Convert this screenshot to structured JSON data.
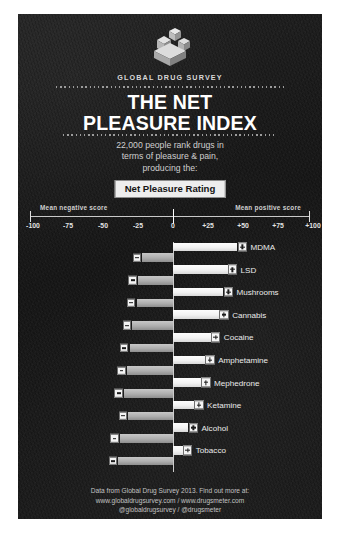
{
  "poster": {
    "brand": "GLOBAL DRUG SURVEY",
    "title_line1": "THE NET",
    "title_line2": "PLEASURE INDEX",
    "subtitle_line1": "22,000 people rank drugs in",
    "subtitle_line2": "terms of pleasure & pain,",
    "subtitle_line3": "producing the:",
    "rating_chip": "Net Pleasure Rating",
    "logo_icon": "global-drug-survey-cubes-logo"
  },
  "axis": {
    "caption_negative": "Mean negative score",
    "caption_positive": "Mean positive score",
    "ticks": [
      "-100",
      "-75",
      "-50",
      "-25",
      "0",
      "+25",
      "+50",
      "+75",
      "+100"
    ],
    "tick_values": [
      -100,
      -75,
      -50,
      -25,
      0,
      25,
      50,
      75,
      100
    ]
  },
  "markers": {
    "positive_icon": "plus-square-icon",
    "negative_icon": "minus-square-icon"
  },
  "footer": {
    "line1": "Data from Global Drug Survey 2013.  Find out more at:",
    "line2": "www.globaldrugsurvey.com  /  www.drugsmeter.com",
    "line3": "@globaldrugsurvey  /  @drugsmeter"
  },
  "colors": {
    "poster_background": "#1b1b1b",
    "positive_bar": "#f2f2f2",
    "negative_bar": "#aeaeae",
    "text": "#ebebeb",
    "chip_background": "#ededed",
    "chip_text": "#141414"
  },
  "chart_data": {
    "type": "bar",
    "orientation": "horizontal",
    "title": "THE NET PLEASURE INDEX",
    "subtitle": "22,000 people rank drugs in terms of pleasure & pain, producing the: Net Pleasure Rating",
    "xlabel": "",
    "ylabel": "",
    "xlim": [
      -100,
      100
    ],
    "xticks": [
      -100,
      -75,
      -50,
      -25,
      0,
      25,
      50,
      75,
      100
    ],
    "xticklabels": [
      "-100",
      "-75",
      "-50",
      "-25",
      "0",
      "+25",
      "+50",
      "+75",
      "+100"
    ],
    "grid": false,
    "legend": [
      "Mean positive score",
      "Mean negative score"
    ],
    "legend_position": "above-axis",
    "categories": [
      "MDMA",
      "LSD",
      "Mushrooms",
      "Cannabis",
      "Cocaine",
      "Amphetamine",
      "Mephedrone",
      "Ketamine",
      "Alcohol",
      "Tobacco"
    ],
    "series": [
      {
        "name": "Mean positive score",
        "values": [
          46,
          39,
          36,
          33,
          27,
          23,
          20,
          15,
          11,
          7
        ]
      },
      {
        "name": "Mean negative score",
        "values": [
          -22,
          -25,
          -26,
          -29,
          -31,
          -33,
          -35,
          -32,
          -38,
          -39
        ]
      }
    ]
  }
}
